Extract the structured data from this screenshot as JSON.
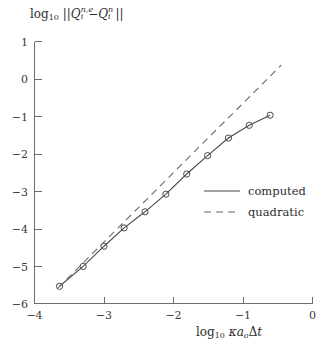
{
  "chart_data": {
    "type": "line",
    "title": "",
    "subtitle": "",
    "xlabel": "log10 kappa a_o Delta t",
    "ylabel": "log10 ||Q_i^{n,e} - Q_i^{n}||",
    "xlim": [
      -4,
      0
    ],
    "ylim": [
      -6,
      1
    ],
    "xticks": [
      -4,
      -3,
      -2,
      -1,
      0
    ],
    "yticks": [
      1,
      0,
      -1,
      -2,
      -3,
      -4,
      -5,
      -6
    ],
    "xtick_labels": [
      "−4",
      "−3",
      "−2",
      "−1",
      "0"
    ],
    "ytick_labels": [
      "1",
      "0",
      "−1",
      "−2",
      "−3",
      "−4",
      "−5",
      "−6"
    ],
    "grid": false,
    "legend_position": "center-right",
    "marker": "circle-open",
    "series": [
      {
        "name": "computed",
        "style": "solid",
        "color": "#4a4a4a",
        "markers": true,
        "x": [
          -3.64,
          -3.3,
          -3.0,
          -2.71,
          -2.41,
          -2.11,
          -1.81,
          -1.51,
          -1.21,
          -0.91,
          -0.61
        ],
        "y": [
          -5.54,
          -5.01,
          -4.47,
          -3.98,
          -3.55,
          -3.08,
          -2.54,
          -2.05,
          -1.58,
          -1.24,
          -0.97
        ]
      },
      {
        "name": "quadratic",
        "style": "dashed",
        "color": "#6a6a6a",
        "markers": false,
        "slope": 2,
        "x": [
          -3.66,
          -0.45
        ],
        "y": [
          -5.58,
          0.37
        ]
      }
    ]
  },
  "axes": {
    "y_title_parts": {
      "log": "log",
      "log_sub": "10",
      "norm_open": "||",
      "q": "Q",
      "q1_sub": "i",
      "q1_sup": "n,e",
      "minus": "−",
      "q2_sub": "i",
      "q2_sup": "n",
      "norm_close": "||"
    },
    "x_title_parts": {
      "log": "log",
      "log_sub": "10",
      "kappa": "κ",
      "a": "a",
      "a_sub": "o",
      "delta": "Δ",
      "t": "t"
    }
  },
  "legend": {
    "entries": [
      {
        "label": "computed",
        "style": "solid"
      },
      {
        "label": "quadratic",
        "style": "dashed"
      }
    ]
  },
  "colors": {
    "axis": "#6e6e6e",
    "solid_series": "#4a4a4a",
    "dashed_series": "#6a6a6a",
    "text": "#2e2e2e",
    "background": "#ffffff"
  }
}
